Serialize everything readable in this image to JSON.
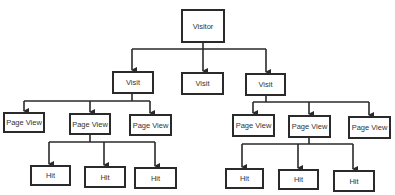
{
  "diagram": {
    "type": "hierarchy",
    "colors": {
      "line": "#2a2a2a",
      "box_border": "#2a2a2a",
      "text": "#333333",
      "background": "#ffffff"
    },
    "nodes": {
      "visitor": {
        "label": "Visitor"
      },
      "visit_1": {
        "label": "Visit"
      },
      "visit_2": {
        "label": "Visit"
      },
      "visit_3": {
        "label": "Visit"
      },
      "pageview_1": {
        "label": "Page View"
      },
      "pageview_2": {
        "label": "Page View"
      },
      "pageview_3": {
        "label": "Page View"
      },
      "pageview_4": {
        "label": "Page View"
      },
      "pageview_5": {
        "label": "Page View"
      },
      "pageview_6": {
        "label": "Page View"
      },
      "hit_1": {
        "label": "Hit"
      },
      "hit_2": {
        "label": "Hit"
      },
      "hit_3": {
        "label": "Hit"
      },
      "hit_4": {
        "label": "Hit"
      },
      "hit_5": {
        "label": "Hit"
      },
      "hit_6": {
        "label": "Hit"
      }
    },
    "edges": [
      [
        "visitor",
        "visit_1"
      ],
      [
        "visitor",
        "visit_2"
      ],
      [
        "visitor",
        "visit_3"
      ],
      [
        "visit_1",
        "pageview_1"
      ],
      [
        "visit_1",
        "pageview_2"
      ],
      [
        "visit_1",
        "pageview_3"
      ],
      [
        "visit_3",
        "pageview_4"
      ],
      [
        "visit_3",
        "pageview_5"
      ],
      [
        "visit_3",
        "pageview_6"
      ],
      [
        "pageview_2",
        "hit_1"
      ],
      [
        "pageview_2",
        "hit_2"
      ],
      [
        "pageview_2",
        "hit_3"
      ],
      [
        "pageview_5",
        "hit_4"
      ],
      [
        "pageview_5",
        "hit_5"
      ],
      [
        "pageview_5",
        "hit_6"
      ]
    ]
  }
}
